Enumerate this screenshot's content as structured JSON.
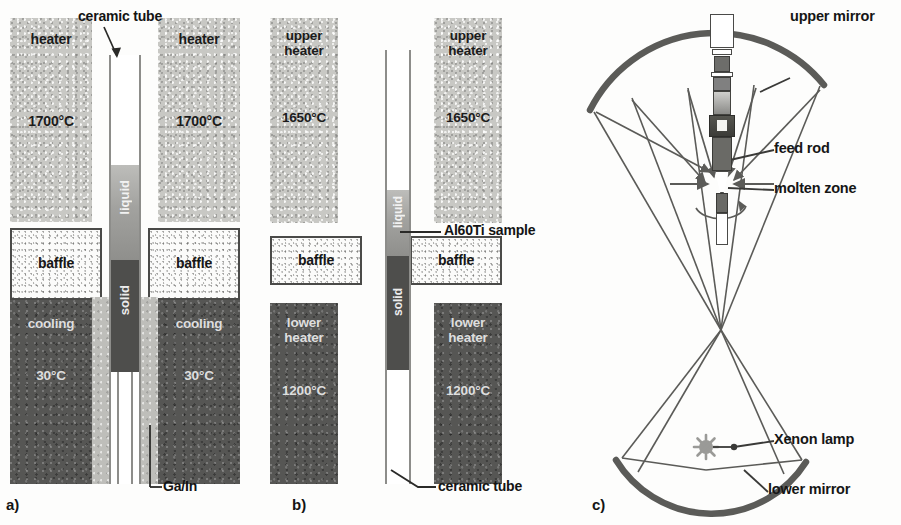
{
  "figure": {
    "panels": [
      "a)",
      "b)",
      "c)"
    ]
  },
  "colors": {
    "heater_fill": "#c8c8c4",
    "dark_fill": "#565654",
    "baffle_fill": "#fbfbfa",
    "liquid_fill": "#a2a29f",
    "solid_fill": "#4e4e4c",
    "gain_fill": "#bebeba",
    "line": "#4a4a48",
    "text": "#141414"
  },
  "panel_a": {
    "letter": "a)",
    "heater_left": {
      "name": "heater",
      "temperature": "1700°C"
    },
    "heater_right": {
      "name": "heater",
      "temperature": "1700°C"
    },
    "baffle_left": "baffle",
    "baffle_right": "baffle",
    "cooling_left": {
      "name": "cooling",
      "temperature": "30°C"
    },
    "cooling_right": {
      "name": "cooling",
      "temperature": "30°C"
    },
    "tube_label": "ceramic tube",
    "phase_liquid": "liquid",
    "phase_solid": "solid",
    "coolant_label": "Ga/In"
  },
  "panel_b": {
    "letter": "b)",
    "upper_heater_left": {
      "name": "upper\nheater",
      "temperature": "1650°C"
    },
    "upper_heater_right": {
      "name": "upper\nheater",
      "temperature": "1650°C"
    },
    "baffle_left": "baffle",
    "baffle_right": "baffle",
    "lower_heater_left": {
      "name": "lower\nheater",
      "temperature": "1200°C"
    },
    "lower_heater_right": {
      "name": "lower\nheater",
      "temperature": "1200°C"
    },
    "sample_label": "Al60Ti sample",
    "tube_label": "ceramic tube",
    "phase_liquid": "liquid",
    "phase_solid": "solid"
  },
  "panel_c": {
    "letter": "c)",
    "labels": {
      "upper_mirror": "upper mirror",
      "feed_rod": "feed rod",
      "molten_zone": "molten zone",
      "xenon_lamp": "Xenon lamp",
      "lower_mirror": "lower mirror"
    },
    "icons": {
      "lamp": "xenon-lamp-icon",
      "mirror": "mirror-arc-icon",
      "ray": "light-ray-arrow"
    }
  }
}
